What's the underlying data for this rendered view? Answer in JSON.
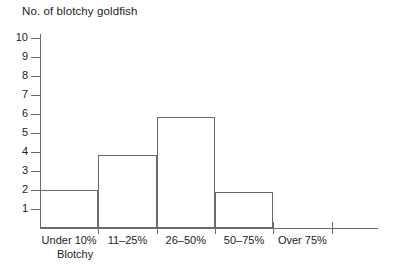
{
  "chart_data": {
    "type": "bar",
    "title": "No. of blotchy goldfish",
    "xlabel": "Blotchy",
    "ylabel": "No. of blotchy goldfish",
    "categories": [
      "Under 10%",
      "11–25%",
      "26–50%",
      "50–75%",
      "Over 75%"
    ],
    "values": [
      2,
      3.85,
      5.85,
      1.9,
      0
    ],
    "ylim": [
      0,
      10
    ],
    "ytick_labels": [
      "1",
      "2",
      "3",
      "4",
      "5",
      "6",
      "7",
      "8",
      "9",
      "10"
    ],
    "ytick_values": [
      1,
      2,
      3,
      4,
      5,
      6,
      7,
      8,
      9,
      10
    ],
    "grid": false,
    "legend": false,
    "axis_color": "#6b6b6b",
    "text_color": "#1c1c1c",
    "bar_fill": "none",
    "bar_edge_color": "#6b6b6b"
  }
}
